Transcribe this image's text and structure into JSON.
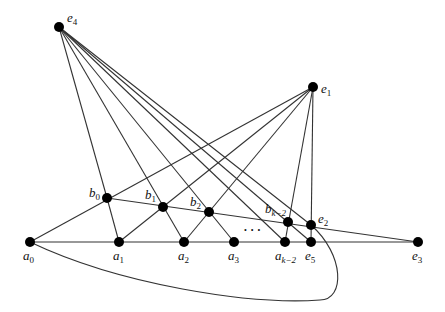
{
  "diagram": {
    "colors": {
      "edge": "#333333",
      "node": "#000000",
      "background": "#ffffff"
    },
    "nodes": [
      {
        "id": "e4",
        "x": 59,
        "y": 27,
        "base": "e",
        "sub": "4",
        "lx": 67,
        "ly": 22,
        "pos": "above-right"
      },
      {
        "id": "e1",
        "x": 313,
        "y": 87,
        "base": "e",
        "sub": "1",
        "lx": 321,
        "ly": 93,
        "pos": "right"
      },
      {
        "id": "b0",
        "x": 107,
        "y": 198,
        "base": "b",
        "sub": "0",
        "lx": 89,
        "ly": 197,
        "pos": "left"
      },
      {
        "id": "b1",
        "x": 163,
        "y": 207,
        "base": "b",
        "sub": "1",
        "lx": 145,
        "ly": 199,
        "pos": "above-left"
      },
      {
        "id": "b2",
        "x": 209,
        "y": 212,
        "base": "b",
        "sub": "2",
        "lx": 190,
        "ly": 206,
        "pos": "above-left"
      },
      {
        "id": "bk2",
        "x": 288,
        "y": 222,
        "base": "b",
        "sub": "k−2",
        "lx": 265,
        "ly": 213,
        "pos": "above-left"
      },
      {
        "id": "e2",
        "x": 311,
        "y": 225,
        "base": "e",
        "sub": "2",
        "lx": 318,
        "ly": 223,
        "pos": "right"
      },
      {
        "id": "a0",
        "x": 30,
        "y": 242,
        "base": "a",
        "sub": "0",
        "lx": 23,
        "ly": 260,
        "pos": "below"
      },
      {
        "id": "a1",
        "x": 119,
        "y": 242,
        "base": "a",
        "sub": "1",
        "lx": 113,
        "ly": 260,
        "pos": "below"
      },
      {
        "id": "a2",
        "x": 184,
        "y": 242,
        "base": "a",
        "sub": "2",
        "lx": 178,
        "ly": 260,
        "pos": "below"
      },
      {
        "id": "a3",
        "x": 234,
        "y": 242,
        "base": "a",
        "sub": "3",
        "lx": 228,
        "ly": 260,
        "pos": "below"
      },
      {
        "id": "ak2",
        "x": 285,
        "y": 242,
        "base": "a",
        "sub": "k−2",
        "lx": 275,
        "ly": 260,
        "pos": "below"
      },
      {
        "id": "e5",
        "x": 311,
        "y": 242,
        "base": "e",
        "sub": "5",
        "lx": 305,
        "ly": 260,
        "pos": "below"
      },
      {
        "id": "e3",
        "x": 418,
        "y": 242,
        "base": "e",
        "sub": "3",
        "lx": 412,
        "ly": 260,
        "pos": "below"
      }
    ],
    "edges": [
      [
        "a0",
        "e3"
      ],
      [
        "b0",
        "e3"
      ],
      [
        "e4",
        "b0"
      ],
      [
        "b0",
        "a1"
      ],
      [
        "e4",
        "a2"
      ],
      [
        "e4",
        "a3"
      ],
      [
        "e4",
        "ak2"
      ],
      [
        "e4",
        "e5"
      ],
      [
        "e1",
        "a0"
      ],
      [
        "e1",
        "a1"
      ],
      [
        "e1",
        "a2"
      ],
      [
        "e1",
        "ak2"
      ],
      [
        "e1",
        "e5"
      ]
    ],
    "curve": {
      "from": "e4",
      "to": "a0",
      "path": "M59,27 L311,225 C345,255 345,300 320,300 C250,305 120,285 30,242"
    },
    "ellipsis": {
      "text": "• • •",
      "x": 244,
      "y": 233
    }
  }
}
